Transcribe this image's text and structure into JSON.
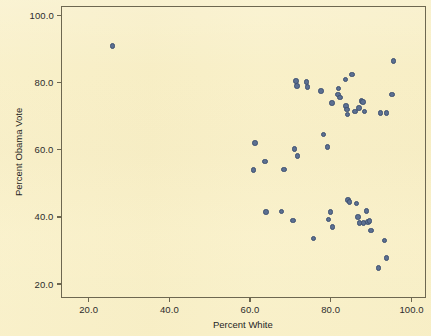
{
  "chart_data": {
    "type": "scatter",
    "title": "",
    "xlabel": "Percent White",
    "ylabel": "Percent Obama Vote",
    "xlim": [
      13.0,
      103.5
    ],
    "ylim": [
      16.0,
      103.0
    ],
    "xticks": [
      20.0,
      40.0,
      60.0,
      80.0,
      100.0
    ],
    "yticks": [
      20.0,
      40.0,
      60.0,
      80.0,
      100.0
    ],
    "xtick_labels": [
      "20.0",
      "40.0",
      "60.0",
      "80.0",
      "100.0"
    ],
    "ytick_labels": [
      "20.0",
      "40.0",
      "60.0",
      "80.0",
      "100.0"
    ],
    "grid": false,
    "legend": false,
    "marker": {
      "shape": "circle",
      "fill_color": "#5b6f91",
      "edge_color": "#3c4f70",
      "size_px": 5.4
    },
    "background_color": "#f8efc6",
    "frame_color": "#6d6750",
    "n_points": 53,
    "points": [
      {
        "x": 25.9,
        "y": 90.9
      },
      {
        "x": 42.5,
        "y": 111.0
      },
      {
        "x": 60.8,
        "y": 54.0
      },
      {
        "x": 61.2,
        "y": 62.0
      },
      {
        "x": 63.7,
        "y": 56.5
      },
      {
        "x": 64.0,
        "y": 41.5
      },
      {
        "x": 67.8,
        "y": 41.7
      },
      {
        "x": 68.4,
        "y": 54.2
      },
      {
        "x": 70.6,
        "y": 39.0
      },
      {
        "x": 71.0,
        "y": 60.3
      },
      {
        "x": 71.4,
        "y": 80.5
      },
      {
        "x": 71.6,
        "y": 79.0
      },
      {
        "x": 71.8,
        "y": 58.2
      },
      {
        "x": 74.0,
        "y": 80.2
      },
      {
        "x": 74.3,
        "y": 78.7
      },
      {
        "x": 75.8,
        "y": 33.6
      },
      {
        "x": 77.6,
        "y": 77.5
      },
      {
        "x": 78.2,
        "y": 64.5
      },
      {
        "x": 79.2,
        "y": 60.8
      },
      {
        "x": 79.4,
        "y": 39.3
      },
      {
        "x": 80.0,
        "y": 41.5
      },
      {
        "x": 80.3,
        "y": 74.0
      },
      {
        "x": 80.5,
        "y": 37.0
      },
      {
        "x": 81.8,
        "y": 76.5
      },
      {
        "x": 82.0,
        "y": 78.2
      },
      {
        "x": 82.3,
        "y": 75.5
      },
      {
        "x": 83.6,
        "y": 81.0
      },
      {
        "x": 83.8,
        "y": 73.0
      },
      {
        "x": 84.0,
        "y": 72.0
      },
      {
        "x": 84.2,
        "y": 70.5
      },
      {
        "x": 84.3,
        "y": 45.0
      },
      {
        "x": 84.6,
        "y": 44.5
      },
      {
        "x": 85.3,
        "y": 82.5
      },
      {
        "x": 86.0,
        "y": 71.5
      },
      {
        "x": 86.4,
        "y": 44.0
      },
      {
        "x": 86.8,
        "y": 40.0
      },
      {
        "x": 87.0,
        "y": 72.5
      },
      {
        "x": 87.2,
        "y": 38.2
      },
      {
        "x": 87.6,
        "y": 74.5
      },
      {
        "x": 88.0,
        "y": 74.2
      },
      {
        "x": 88.2,
        "y": 38.2
      },
      {
        "x": 88.4,
        "y": 71.5
      },
      {
        "x": 88.8,
        "y": 41.8
      },
      {
        "x": 89.2,
        "y": 38.5
      },
      {
        "x": 89.6,
        "y": 38.8
      },
      {
        "x": 90.0,
        "y": 36.0
      },
      {
        "x": 91.8,
        "y": 24.8
      },
      {
        "x": 92.4,
        "y": 71.0
      },
      {
        "x": 93.4,
        "y": 33.0
      },
      {
        "x": 93.8,
        "y": 27.8
      },
      {
        "x": 93.9,
        "y": 71.0
      },
      {
        "x": 95.2,
        "y": 76.5
      },
      {
        "x": 95.6,
        "y": 86.5
      }
    ]
  }
}
